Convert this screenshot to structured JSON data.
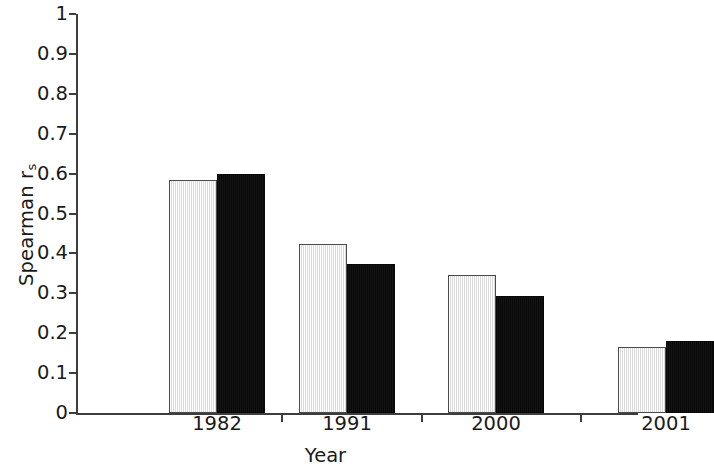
{
  "chart_data": {
    "type": "bar",
    "title": "",
    "subtitle": "",
    "xlabel": "Year",
    "ylabel": "Spearman r_s",
    "ylabel_main": "Spearman r",
    "ylabel_sub": "s",
    "categories": [
      "1982",
      "1991",
      "2000",
      "2001"
    ],
    "series": [
      {
        "name": "light-series",
        "color": "#e9e9e9",
        "values": [
          0.585,
          0.424,
          0.345,
          0.165
        ]
      },
      {
        "name": "dark-series",
        "color": "#090909",
        "values": [
          0.6,
          0.374,
          0.294,
          0.18
        ]
      }
    ],
    "ylim": [
      0,
      1
    ],
    "ytick_labels": [
      "1",
      "0.9",
      "0.8",
      "0.7",
      "0.6",
      "0.5",
      "0.4",
      "0.3",
      "0.2",
      "0.1",
      "0"
    ],
    "ytick_values": [
      1,
      0.9,
      0.8,
      0.7,
      0.6,
      0.5,
      0.4,
      0.3,
      0.2,
      0.1,
      0
    ],
    "grid": false,
    "legend": "none",
    "axis_color": "#3d3d3d"
  }
}
